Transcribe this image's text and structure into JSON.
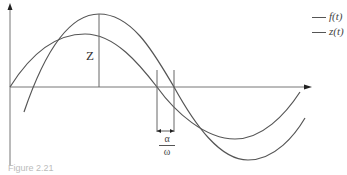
{
  "figure": {
    "caption": "Figure 2.21",
    "amplitude_label": "Z",
    "phase_label": {
      "numerator": "α",
      "denominator": "ω"
    },
    "legend": [
      {
        "label": "f(t)",
        "color": "#555555"
      },
      {
        "label": "z(t)",
        "color": "#555555"
      }
    ],
    "line_color": "#555555",
    "axis_color": "#777777"
  }
}
